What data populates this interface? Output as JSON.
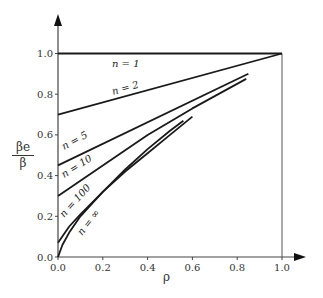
{
  "chart_data": {
    "type": "line",
    "title": "",
    "xlabel": "ρ",
    "ylabel": "βe / β",
    "ylabel_num": "βe",
    "ylabel_den": "β",
    "xlim": [
      0,
      1.0
    ],
    "ylim": [
      0,
      1.0
    ],
    "grid": false,
    "legend": "inline labels",
    "x_ticks": [
      "0.0",
      "0.2",
      "0.4",
      "0.6",
      "0.8",
      "1.0"
    ],
    "y_ticks": [
      "0.0",
      "0.2",
      "0.4",
      "0.6",
      "0.8",
      "1.0"
    ],
    "series": [
      {
        "name": "n = 1",
        "x": [
          0,
          1.0
        ],
        "y": [
          1.0,
          1.0
        ]
      },
      {
        "name": "n = 2",
        "x": [
          0,
          1.0
        ],
        "y": [
          0.7,
          1.0
        ]
      },
      {
        "name": "n = 5",
        "x": [
          0,
          0.85
        ],
        "y": [
          0.45,
          0.9
        ]
      },
      {
        "name": "n = 10",
        "x": [
          0,
          0.2,
          0.4,
          0.6,
          0.84
        ],
        "y": [
          0.3,
          0.45,
          0.6,
          0.73,
          0.875
        ]
      },
      {
        "name": "n = 100",
        "x": [
          0,
          0.05,
          0.1,
          0.2,
          0.3,
          0.4,
          0.5,
          0.6
        ],
        "y": [
          0.07,
          0.15,
          0.21,
          0.32,
          0.42,
          0.51,
          0.6,
          0.69
        ]
      },
      {
        "name": "n = ∞",
        "x": [
          0,
          0.02,
          0.05,
          0.1,
          0.2,
          0.3,
          0.4,
          0.5,
          0.56
        ],
        "y": [
          0,
          0.06,
          0.12,
          0.2,
          0.32,
          0.43,
          0.53,
          0.62,
          0.67
        ]
      }
    ],
    "annotations": [
      {
        "text": "n = 1"
      },
      {
        "text": "n = 2"
      },
      {
        "text": "n = 5"
      },
      {
        "text": "n = 10"
      },
      {
        "text": "n = 100"
      },
      {
        "text": "n = ∞"
      }
    ]
  }
}
